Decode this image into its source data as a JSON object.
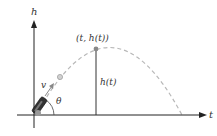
{
  "diagram": {
    "axes": {
      "vertical_label": "h",
      "horizontal_label": "t"
    },
    "labels": {
      "point": "(t, h(t))",
      "height": "h(t)",
      "velocity": "v",
      "angle": "θ"
    },
    "colors": {
      "axis": "#222222",
      "trajectory": "#b5b5b5",
      "point": "#888888",
      "ball": "#bdbdbd",
      "cannon": "#333333",
      "velocity_arrow": "#888888"
    }
  }
}
